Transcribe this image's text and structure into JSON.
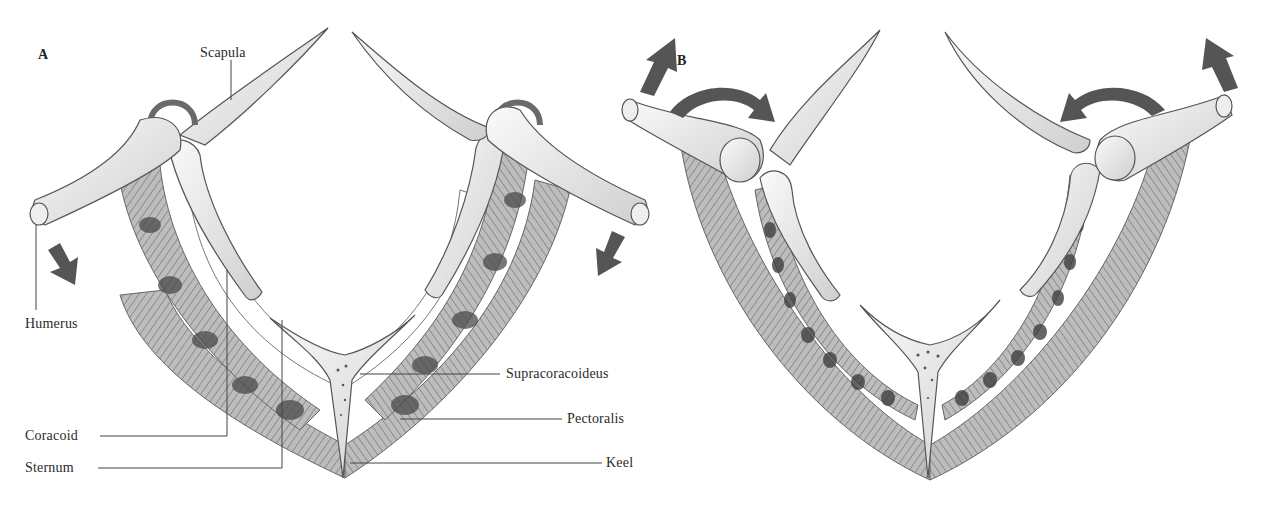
{
  "figure": {
    "colors": {
      "background": "#ffffff",
      "bone_fill": "#f1f1f1",
      "bone_stroke": "#555555",
      "muscle_fill": "#b8b8b8",
      "muscle_dark": "#555555",
      "arrow": "#555555",
      "label_text": "#2a2a2a",
      "leader_line": "#444444"
    }
  },
  "panels": [
    {
      "id": "A",
      "letter": "A",
      "wing_motion": "down",
      "arrows": [
        {
          "name": "left-humerus-down-arrow",
          "direction": "down-right"
        },
        {
          "name": "right-humerus-down-arrow",
          "direction": "down-left"
        }
      ],
      "labels": [
        {
          "text": "Scapula"
        },
        {
          "text": "Humerus"
        },
        {
          "text": "Coracoid"
        },
        {
          "text": "Sternum"
        },
        {
          "text": "Supracoracoideus"
        },
        {
          "text": "Pectoralis"
        },
        {
          "text": "Keel"
        }
      ]
    },
    {
      "id": "B",
      "letter": "B",
      "wing_motion": "up",
      "arrows": [
        {
          "name": "left-humerus-up-arrow",
          "direction": "up"
        },
        {
          "name": "left-rotation-arrow",
          "direction": "curved-clockwise"
        },
        {
          "name": "right-rotation-arrow",
          "direction": "curved-counterclockwise"
        },
        {
          "name": "right-humerus-up-arrow",
          "direction": "up"
        }
      ],
      "labels": []
    }
  ]
}
